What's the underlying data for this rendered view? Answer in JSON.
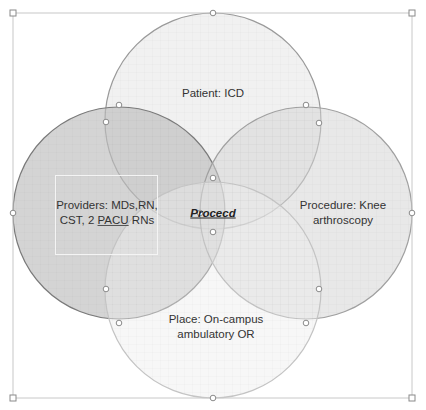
{
  "diagram": {
    "type": "venn",
    "selection_frame": {
      "x": 13,
      "y": 13,
      "width": 399,
      "height": 385
    },
    "circles": [
      {
        "id": "patient",
        "label": "Patient: ICD",
        "cx": 213,
        "cy": 121,
        "r": 108,
        "fill": "#e6e6e6",
        "opacity": 0.55,
        "stroke": "#9a9a9a"
      },
      {
        "id": "providers",
        "label": "Providers: MDs,RN, CST, 2 PACU RNs",
        "cx": 119,
        "cy": 213,
        "r": 106,
        "fill": "#bdbdbd",
        "opacity": 0.65,
        "stroke": "#7a7a7a"
      },
      {
        "id": "procedure",
        "label": "Procedure: Knee arthroscopy",
        "cx": 306,
        "cy": 213,
        "r": 106,
        "fill": "#d6d6d6",
        "opacity": 0.55,
        "stroke": "#a0a0a0"
      },
      {
        "id": "place",
        "label": "Place: On-campus ambulatory OR",
        "cx": 213,
        "cy": 290,
        "r": 108,
        "fill": "#eeeeee",
        "opacity": 0.45,
        "stroke": "#c4c4c4"
      }
    ],
    "labels": {
      "patient": "Patient: ICD",
      "providers_line1": "Providers: MDs,RN,",
      "providers_line2_a": "CST, 2 ",
      "providers_line2_u": "PACU",
      "providers_line2_b": " RNs",
      "procedure_line1": "Procedure: Knee",
      "procedure_line2": "arthroscopy",
      "place_line1": "Place: On-campus",
      "place_line2": "ambulatory OR",
      "center": "Procecd"
    },
    "handles": [
      [
        13,
        13
      ],
      [
        213,
        13
      ],
      [
        412,
        13
      ],
      [
        13,
        213
      ],
      [
        412,
        213
      ],
      [
        13,
        398
      ],
      [
        213,
        398
      ],
      [
        412,
        398
      ],
      [
        119,
        105
      ],
      [
        106,
        122
      ],
      [
        306,
        105
      ],
      [
        319,
        123
      ],
      [
        106,
        289
      ],
      [
        119,
        323
      ],
      [
        319,
        289
      ],
      [
        306,
        323
      ],
      [
        213,
        178
      ],
      [
        213,
        232
      ],
      [
        200,
        213
      ]
    ],
    "colors": {
      "background": "#ffffff",
      "frame": "#c8c8c8",
      "handle_fill": "#ffffff",
      "handle_stroke": "#8a8a8a",
      "text": "#333333"
    }
  }
}
